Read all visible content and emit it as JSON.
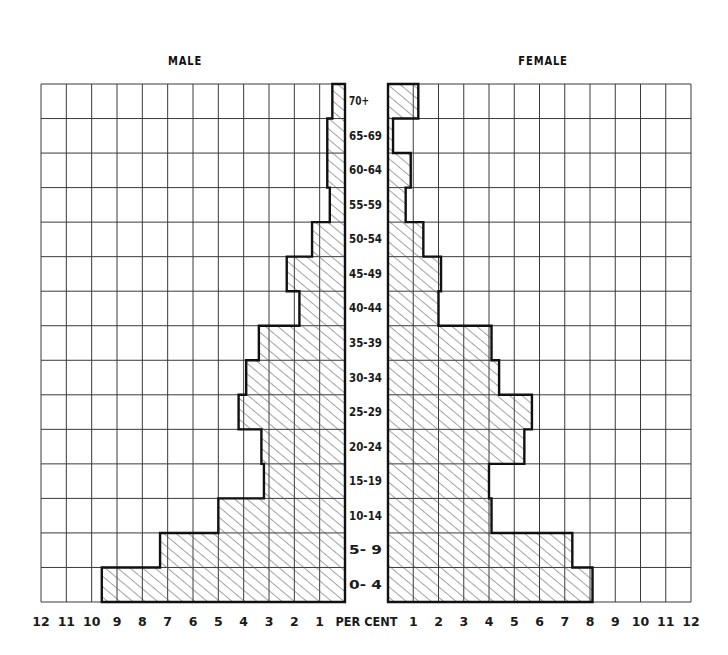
{
  "chart_data": {
    "type": "bar",
    "orientation": "horizontal",
    "subtype": "population-pyramid",
    "title": "",
    "left_title": "MALE",
    "right_title": "FEMALE",
    "xlabel": "PER CENT",
    "ylabel": "",
    "categories": [
      "70+",
      "65-69",
      "60-64",
      "55-59",
      "50-54",
      "45-49",
      "40-44",
      "35-39",
      "30-34",
      "25-29",
      "20-24",
      "15-19",
      "10-14",
      "5- 9",
      "0- 4"
    ],
    "series": [
      {
        "name": "MALE",
        "side": "left",
        "values": [
          0.5,
          0.7,
          0.7,
          0.6,
          1.3,
          2.3,
          1.8,
          3.4,
          3.9,
          4.2,
          3.3,
          3.2,
          5.0,
          7.3,
          9.6
        ]
      },
      {
        "name": "FEMALE",
        "side": "right",
        "values": [
          1.2,
          0.2,
          0.9,
          0.7,
          1.4,
          2.1,
          2.0,
          4.1,
          4.4,
          5.7,
          5.4,
          4.0,
          4.1,
          7.3,
          8.1
        ]
      }
    ],
    "x_ticks_left": [
      "12",
      "11",
      "10",
      "9",
      "8",
      "7",
      "6",
      "5",
      "4",
      "3",
      "2",
      "1"
    ],
    "x_ticks_right": [
      "1",
      "2",
      "3",
      "4",
      "5",
      "6",
      "7",
      "8",
      "9",
      "10",
      "11",
      "12"
    ],
    "xlim": [
      0,
      12
    ],
    "grid": true,
    "fill": "diagonal-hatch",
    "legend": "none"
  },
  "colors": {
    "grid": "#3a3a3a",
    "bar_outline": "#111111",
    "hatch": "#555555",
    "background": "#ffffff"
  }
}
